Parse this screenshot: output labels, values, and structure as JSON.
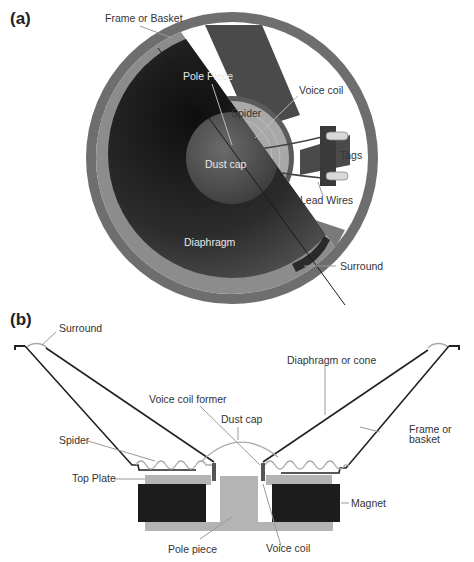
{
  "figure": {
    "panel_a": {
      "tag": "(a)",
      "title_view": "front cutaway view",
      "labels": {
        "frame": "Frame or Basket",
        "pole_piece": "Pole Piece",
        "voice_coil": "Voice coil",
        "spider": "Spider",
        "tags": "Tags",
        "dust_cap": "Dust cap",
        "lead_wires": "Lead Wires",
        "diaphragm": "Diaphragm",
        "surround": "Surround"
      }
    },
    "panel_b": {
      "tag": "(b)",
      "title_view": "cross-section view",
      "labels": {
        "surround": "Surround",
        "diaphragm": "Diaphragm or cone",
        "voice_coil_former": "Voice coil former",
        "dust_cap": "Dust cap",
        "frame_line1": "Frame or",
        "frame_line2": "basket",
        "spider": "Spider",
        "top_plate": "Top Plate",
        "magnet": "Magnet",
        "pole_piece": "Pole piece",
        "voice_coil": "Voice coil"
      }
    },
    "colors": {
      "frame": "#6e6e6e",
      "diaphragm_dark": "#2a2a2a",
      "spider": "#9a9a9a",
      "magnet": "#1c1c1c",
      "plate": "#b4b4b4",
      "line": "#222222"
    }
  }
}
